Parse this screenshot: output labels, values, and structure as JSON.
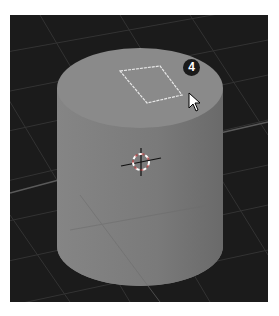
{
  "viewport": {
    "label": "3D Viewport",
    "background": "#1b1b1b",
    "grid_color": "#3a3a3a",
    "object": {
      "type": "cylinder",
      "color_top": "#8a8a8a",
      "color_side": "#7c7c7c",
      "selection_face": "top",
      "selection_outline_color": "#e8e8e8"
    }
  },
  "step_badge": {
    "number": "4"
  },
  "three_d_cursor": {
    "name": "3d-cursor"
  },
  "mouse_pointer": {
    "name": "arrow-pointer"
  }
}
